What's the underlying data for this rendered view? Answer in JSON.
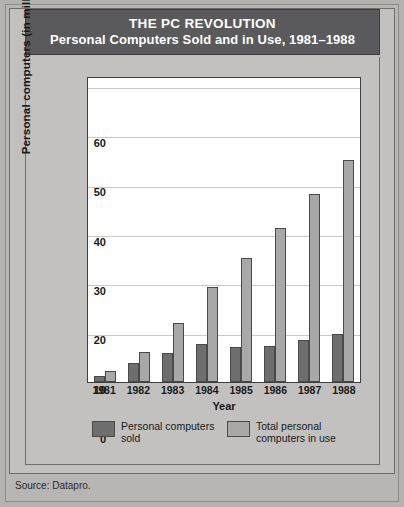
{
  "title": {
    "main": "THE PC REVOLUTION",
    "sub": "Personal Computers Sold and in Use, 1981–1988"
  },
  "source": "Source: Datapro.",
  "legend": [
    {
      "key": "sold",
      "label_line1": "Personal computers",
      "label_line2": "sold",
      "color": "#6e6e6e"
    },
    {
      "key": "use",
      "label_line1": "Total personal",
      "label_line2": "computers in use",
      "color": "#a8a8a8"
    }
  ],
  "colors": {
    "page_background": "#b4b3b1",
    "card_background": "#c2c1bf",
    "title_bar": "#5a5a5c",
    "title_text": "#ffffff",
    "plot_background": "#ffffff",
    "gridline": "#c9c9c9",
    "axis": "#3f3f40",
    "bar_sold": "#6e6e6e",
    "bar_use": "#a8a8a8"
  },
  "chart_data": {
    "type": "bar",
    "title": "THE PC REVOLUTION",
    "subtitle": "Personal Computers Sold and in Use, 1981–1988",
    "xlabel": "Year",
    "ylabel": "Personal computers (in millions)",
    "categories": [
      "1981",
      "1982",
      "1983",
      "1984",
      "1985",
      "1986",
      "1987",
      "1988"
    ],
    "series": [
      {
        "name": "Personal computers sold",
        "color": "#6e6e6e",
        "values": [
          1.3,
          3.8,
          5.8,
          7.8,
          7.0,
          7.3,
          8.5,
          9.7
        ]
      },
      {
        "name": "Total personal computers in use",
        "color": "#a8a8a8",
        "values": [
          2.2,
          6.0,
          12.0,
          19.2,
          25.2,
          31.2,
          38.0,
          45.0
        ]
      }
    ],
    "ylim": [
      0,
      62
    ],
    "yticks": [
      0,
      10,
      20,
      30,
      40,
      50,
      60
    ],
    "ytick_labels": [
      "0",
      "10",
      "20",
      "30",
      "40",
      "50",
      "60"
    ],
    "grid": true,
    "grid_axis": "y",
    "legend_position": "bottom",
    "source": "Source: Datapro."
  }
}
